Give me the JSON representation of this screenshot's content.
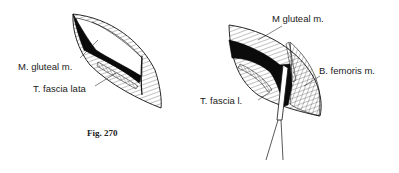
{
  "figure": {
    "caption": "Fig. 270",
    "left_panel": {
      "labels": {
        "gluteal": "M. gluteal m.",
        "fascia": "T. fascia lata"
      }
    },
    "right_panel": {
      "labels": {
        "gluteal": "M gluteal m.",
        "femoris": "B. femoris m.",
        "fascia": "T. fascia l."
      }
    }
  }
}
